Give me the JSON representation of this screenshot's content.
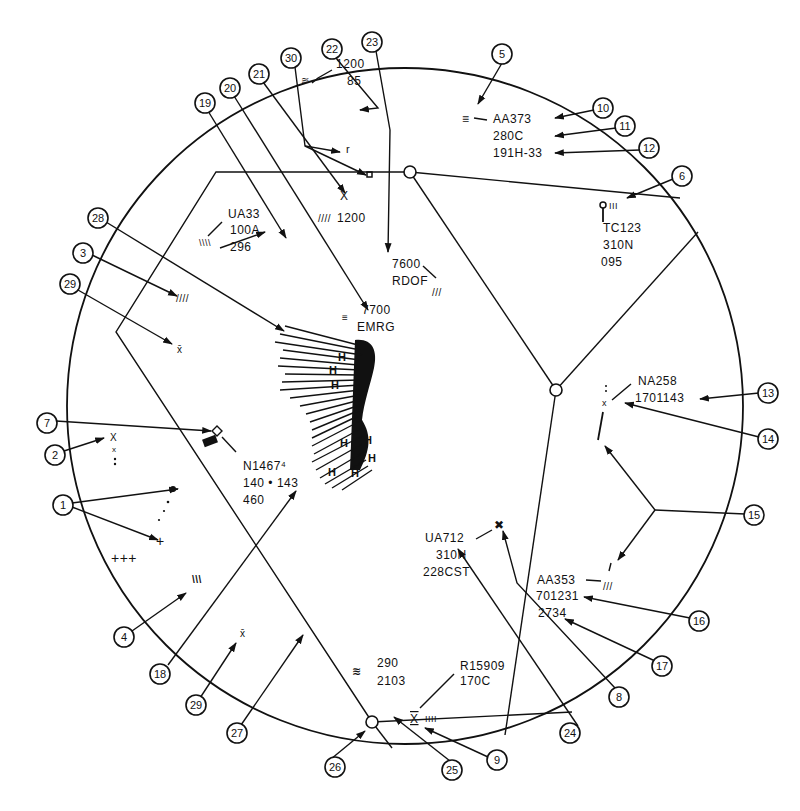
{
  "scope": {
    "center": [
      405,
      406
    ],
    "radius": 338,
    "line_color": "#111111",
    "background": "#ffffff"
  },
  "fixes": [
    {
      "id": "fix-top",
      "x": 410,
      "y": 172
    },
    {
      "id": "fix-center",
      "x": 556,
      "y": 390
    },
    {
      "id": "fix-bottom",
      "x": 372,
      "y": 722
    }
  ],
  "airways": [
    {
      "id": "airway-top-west",
      "points": [
        [
          410,
          172
        ],
        [
          216,
          172
        ],
        [
          116,
          332
        ],
        [
          372,
          722
        ]
      ]
    },
    {
      "id": "airway-top-east",
      "points": [
        [
          410,
          172
        ],
        [
          680,
          200
        ]
      ]
    },
    {
      "id": "airway-top-center",
      "points": [
        [
          410,
          172
        ],
        [
          556,
          390
        ]
      ]
    },
    {
      "id": "airway-center-ne",
      "points": [
        [
          556,
          390
        ],
        [
          698,
          232
        ]
      ]
    },
    {
      "id": "airway-center-south",
      "points": [
        [
          556,
          390
        ],
        [
          505,
          736
        ]
      ]
    },
    {
      "id": "airway-bottom-east",
      "points": [
        [
          372,
          722
        ],
        [
          572,
          712
        ]
      ]
    },
    {
      "id": "airway-bottom-sw",
      "points": [
        [
          372,
          722
        ],
        [
          395,
          750
        ]
      ]
    }
  ],
  "data_blocks": [
    {
      "id": "aa373",
      "lines": [
        "AA373",
        "280C",
        "191H-33"
      ],
      "x": 493,
      "y": 123
    },
    {
      "id": "tc123",
      "lines": [
        "TC123",
        "310N",
        "095"
      ],
      "x": 613,
      "y": 232
    },
    {
      "id": "ua33",
      "lines": [
        "UA33",
        "100A",
        "296"
      ],
      "x": 228,
      "y": 218
    },
    {
      "id": "vfr-1200-85",
      "lines": [
        "1200",
        "85"
      ],
      "x": 333,
      "y": 63
    },
    {
      "id": "vfr-1200",
      "lines": [
        "1200"
      ],
      "x": 346,
      "y": 222
    },
    {
      "id": "x-symbol-top",
      "lines": [
        "X"
      ],
      "x": 347,
      "y": 200
    },
    {
      "id": "hijack-7600",
      "lines": [
        "7600",
        "RDOF"
      ],
      "x": 392,
      "y": 268
    },
    {
      "id": "emergency-7700",
      "lines": [
        "7700",
        "EMRG"
      ],
      "x": 357,
      "y": 314
    },
    {
      "id": "n1467",
      "lines": [
        "N1467⁴",
        "140 • 143",
        "460"
      ],
      "x": 243,
      "y": 462
    },
    {
      "id": "na258",
      "lines": [
        "NA258",
        "1701143"
      ],
      "x": 640,
      "y": 385
    },
    {
      "id": "ua712",
      "lines": [
        "UA712",
        "310N",
        "228CST"
      ],
      "x": 470,
      "y": 538
    },
    {
      "id": "aa353",
      "lines": [
        "AA353",
        "701231",
        "2734"
      ],
      "x": 538,
      "y": 580
    },
    {
      "id": "r15909",
      "lines": [
        "R15909",
        "170C"
      ],
      "x": 460,
      "y": 642
    },
    {
      "id": "track-290",
      "lines": [
        "290",
        "2103"
      ],
      "x": 377,
      "y": 663
    }
  ],
  "callouts": [
    {
      "n": "1",
      "x": 63,
      "y": 505
    },
    {
      "n": "2",
      "x": 55,
      "y": 455
    },
    {
      "n": "3",
      "x": 83,
      "y": 253
    },
    {
      "n": "4",
      "x": 124,
      "y": 637
    },
    {
      "n": "5",
      "x": 502,
      "y": 54
    },
    {
      "n": "6",
      "x": 682,
      "y": 176
    },
    {
      "n": "7",
      "x": 47,
      "y": 423
    },
    {
      "n": "8",
      "x": 619,
      "y": 697
    },
    {
      "n": "9",
      "x": 497,
      "y": 760
    },
    {
      "n": "10",
      "x": 603,
      "y": 108
    },
    {
      "n": "11",
      "x": 625,
      "y": 126
    },
    {
      "n": "12",
      "x": 649,
      "y": 148
    },
    {
      "n": "13",
      "x": 768,
      "y": 393
    },
    {
      "n": "14",
      "x": 768,
      "y": 439
    },
    {
      "n": "15",
      "x": 754,
      "y": 515
    },
    {
      "n": "16",
      "x": 699,
      "y": 621
    },
    {
      "n": "17",
      "x": 662,
      "y": 666
    },
    {
      "n": "18",
      "x": 160,
      "y": 674
    },
    {
      "n": "19",
      "x": 205,
      "y": 103
    },
    {
      "n": "20",
      "x": 230,
      "y": 88
    },
    {
      "n": "21",
      "x": 259,
      "y": 74
    },
    {
      "n": "22",
      "x": 332,
      "y": 49
    },
    {
      "n": "23",
      "x": 372,
      "y": 42
    },
    {
      "n": "24",
      "x": 570,
      "y": 733
    },
    {
      "n": "25",
      "x": 452,
      "y": 770
    },
    {
      "n": "26",
      "x": 335,
      "y": 767
    },
    {
      "n": "27",
      "x": 237,
      "y": 733
    },
    {
      "n": "28",
      "x": 98,
      "y": 218
    },
    {
      "n": "29",
      "x": 70,
      "y": 284
    },
    {
      "n": "29b",
      "label": "29",
      "x": 196,
      "y": 705
    },
    {
      "n": "30",
      "x": 291,
      "y": 58
    }
  ],
  "leaders": [
    {
      "from": [
        72,
        503
      ],
      "to": [
        178,
        489
      ]
    },
    {
      "from": [
        72,
        507
      ],
      "to": [
        158,
        540
      ]
    },
    {
      "from": [
        64,
        451
      ],
      "to": [
        104,
        438
      ]
    },
    {
      "from": [
        92,
        255
      ],
      "to": [
        177,
        296
      ]
    },
    {
      "from": [
        132,
        631
      ],
      "to": [
        188,
        592
      ]
    },
    {
      "from": [
        502,
        63
      ],
      "to": [
        477,
        105
      ]
    },
    {
      "from": [
        673,
        179
      ],
      "to": [
        627,
        198
      ]
    },
    {
      "from": [
        56,
        421
      ],
      "to": [
        211,
        431
      ]
    },
    {
      "from": [
        615,
        688
      ],
      "to": [
        507,
        530
      ]
    },
    {
      "from": [
        488,
        757
      ],
      "to": [
        423,
        728
      ]
    },
    {
      "from": [
        594,
        110
      ],
      "to": [
        555,
        118
      ]
    },
    {
      "from": [
        616,
        128
      ],
      "to": [
        555,
        136
      ]
    },
    {
      "from": [
        640,
        150
      ],
      "to": [
        555,
        153
      ]
    },
    {
      "from": [
        759,
        393
      ],
      "to": [
        700,
        399
      ]
    },
    {
      "from": [
        759,
        437
      ],
      "to": [
        625,
        403
      ]
    },
    {
      "from": [
        662,
        666
      ],
      "to": [
        563,
        620
      ]
    },
    {
      "from": [
        690,
        618
      ],
      "to": [
        582,
        598
      ]
    },
    {
      "from": [
        168,
        665
      ],
      "to": [
        296,
        491
      ]
    },
    {
      "from": [
        208,
        111
      ],
      "to": [
        286,
        238
      ]
    },
    {
      "from": [
        234,
        96
      ],
      "to": [
        368,
        310
      ]
    },
    {
      "from": [
        263,
        82
      ],
      "to": [
        345,
        193
      ]
    },
    {
      "from": [
        578,
        726
      ],
      "to": [
        458,
        548
      ]
    },
    {
      "from": [
        450,
        761
      ],
      "to": [
        398,
        724
      ]
    },
    {
      "from": [
        331,
        759
      ],
      "to": [
        360,
        732
      ]
    },
    {
      "from": [
        241,
        725
      ],
      "to": [
        304,
        634
      ]
    },
    {
      "from": [
        106,
        222
      ],
      "to": [
        284,
        331
      ]
    },
    {
      "from": [
        78,
        290
      ],
      "to": [
        170,
        344
      ]
    },
    {
      "from": [
        200,
        698
      ],
      "to": [
        236,
        643
      ]
    }
  ],
  "legend_note": "ARTS radar scope display with numbered callouts 1-30"
}
